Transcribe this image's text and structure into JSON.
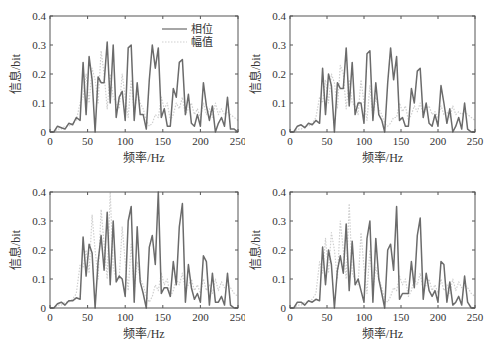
{
  "chart_data": [
    {
      "type": "line",
      "panel": "top-left",
      "title": "",
      "xlabel": "频率/Hz",
      "ylabel": "信息/bit",
      "xlim": [
        0,
        250
      ],
      "ylim": [
        0,
        0.4
      ],
      "xticks": [
        "0",
        "50",
        "100",
        "150",
        "200",
        "250"
      ],
      "yticks": [
        "0",
        "0.1",
        "0.2",
        "0.3",
        "0.4"
      ],
      "grid": false,
      "legend": {
        "position": "upper-right",
        "entries": [
          "相位",
          "幅值"
        ]
      },
      "x": [
        0,
        5,
        10,
        15,
        20,
        25,
        30,
        35,
        40,
        44,
        48,
        52,
        56,
        60,
        64,
        68,
        72,
        76,
        80,
        84,
        88,
        92,
        96,
        100,
        104,
        108,
        112,
        116,
        120,
        124,
        128,
        132,
        136,
        140,
        144,
        148,
        152,
        156,
        160,
        164,
        168,
        172,
        176,
        180,
        184,
        188,
        192,
        196,
        200,
        204,
        208,
        212,
        216,
        220,
        224,
        228,
        232,
        236,
        240,
        245,
        250
      ],
      "series": [
        {
          "name": "相位",
          "style": "solid dark gray",
          "values": [
            0,
            0,
            0.02,
            0.015,
            0.01,
            0.03,
            0.025,
            0.05,
            0.04,
            0.24,
            0.06,
            0.26,
            0.18,
            0,
            0.19,
            0.17,
            0.17,
            0.31,
            0.1,
            0.3,
            0.05,
            0.12,
            0.14,
            0.04,
            0.29,
            0.3,
            0.04,
            0.17,
            0.06,
            0.06,
            0.01,
            0.18,
            0.3,
            0.22,
            0.29,
            0.05,
            0.08,
            0.02,
            0.02,
            0.15,
            0.12,
            0.24,
            0.25,
            0.06,
            0.13,
            0.03,
            0.02,
            0.06,
            0.02,
            0.17,
            0.09,
            0.04,
            0.09,
            0,
            0.03,
            0.05,
            0.02,
            0.12,
            0.01,
            0.01,
            0
          ]
        },
        {
          "name": "幅值",
          "style": "dotted light gray",
          "values": [
            0,
            0,
            0.01,
            0.01,
            0.02,
            0.02,
            0.03,
            0.04,
            0.1,
            0.12,
            0.2,
            0.1,
            0.22,
            0.18,
            0.1,
            0.28,
            0.2,
            0.08,
            0.2,
            0.12,
            0.1,
            0.08,
            0.2,
            0.12,
            0.05,
            0.18,
            0.06,
            0.14,
            0.1,
            0.08,
            0.04,
            0.02,
            0.03,
            0.06,
            0.05,
            0.12,
            0.08,
            0.1,
            0.04,
            0.06,
            0.1,
            0.08,
            0.12,
            0.06,
            0.08,
            0.1,
            0.06,
            0.08,
            0.05,
            0.1,
            0.06,
            0.08,
            0.05,
            0.1,
            0.06,
            0.08,
            0.06,
            0.07,
            0.06,
            0.05,
            0.04
          ]
        }
      ]
    },
    {
      "type": "line",
      "panel": "top-right",
      "title": "",
      "xlabel": "频率/Hz",
      "ylabel": "信息/bit",
      "xlim": [
        0,
        250
      ],
      "ylim": [
        0,
        0.4
      ],
      "xticks": [
        "0",
        "50",
        "100",
        "150",
        "200",
        "250"
      ],
      "yticks": [
        "0",
        "0.1",
        "0.2",
        "0.3",
        "0.4"
      ],
      "grid": false,
      "x": [
        0,
        5,
        10,
        15,
        20,
        25,
        30,
        35,
        40,
        44,
        48,
        52,
        56,
        60,
        64,
        68,
        72,
        76,
        80,
        84,
        88,
        92,
        96,
        100,
        104,
        108,
        112,
        116,
        120,
        124,
        128,
        132,
        136,
        140,
        144,
        148,
        152,
        156,
        160,
        164,
        168,
        172,
        176,
        180,
        184,
        188,
        192,
        196,
        200,
        204,
        208,
        212,
        216,
        220,
        224,
        228,
        232,
        236,
        240,
        245,
        250
      ],
      "series": [
        {
          "name": "相位",
          "style": "solid dark gray",
          "values": [
            0,
            0,
            0.02,
            0.025,
            0.015,
            0.03,
            0.025,
            0.04,
            0.03,
            0.22,
            0.06,
            0.2,
            0.16,
            0,
            0.17,
            0.15,
            0.15,
            0.29,
            0.09,
            0.24,
            0.06,
            0.1,
            0.1,
            0.03,
            0.27,
            0.28,
            0.04,
            0.17,
            0.06,
            0.04,
            0,
            0.17,
            0.29,
            0.18,
            0.26,
            0.04,
            0.05,
            0.02,
            0.02,
            0.15,
            0.1,
            0.21,
            0.22,
            0.05,
            0.1,
            0.03,
            0.02,
            0.06,
            0.02,
            0.16,
            0.1,
            0.03,
            0.08,
            0,
            0.02,
            0.05,
            0.01,
            0.1,
            0.01,
            0,
            0
          ]
        },
        {
          "name": "幅值",
          "style": "dotted light gray",
          "values": [
            0,
            0,
            0.01,
            0.01,
            0.02,
            0.02,
            0.03,
            0.05,
            0.12,
            0.1,
            0.18,
            0.1,
            0.2,
            0.17,
            0.08,
            0.23,
            0.2,
            0.08,
            0.18,
            0.1,
            0.09,
            0.06,
            0.18,
            0.1,
            0.04,
            0.16,
            0.05,
            0.12,
            0.08,
            0.06,
            0.03,
            0.02,
            0.03,
            0.05,
            0.05,
            0.1,
            0.07,
            0.09,
            0.04,
            0.06,
            0.09,
            0.07,
            0.1,
            0.06,
            0.08,
            0.09,
            0.06,
            0.07,
            0.05,
            0.09,
            0.06,
            0.07,
            0.05,
            0.09,
            0.06,
            0.07,
            0.06,
            0.07,
            0.06,
            0.05,
            0.04
          ]
        }
      ]
    },
    {
      "type": "line",
      "panel": "bottom-left",
      "title": "",
      "xlabel": "频率/Hz",
      "ylabel": "信息/bit",
      "xlim": [
        0,
        250
      ],
      "ylim": [
        0,
        0.4
      ],
      "xticks": [
        "0",
        "50",
        "100",
        "150",
        "200",
        "250"
      ],
      "yticks": [
        "0",
        "0.1",
        "0.2",
        "0.3",
        "0.4"
      ],
      "grid": false,
      "x": [
        0,
        5,
        10,
        15,
        20,
        25,
        30,
        35,
        40,
        44,
        48,
        52,
        56,
        60,
        64,
        68,
        72,
        76,
        80,
        84,
        88,
        92,
        96,
        100,
        104,
        108,
        112,
        116,
        120,
        124,
        128,
        132,
        136,
        140,
        144,
        148,
        152,
        156,
        160,
        164,
        168,
        172,
        176,
        180,
        184,
        188,
        192,
        196,
        200,
        204,
        208,
        212,
        216,
        220,
        224,
        228,
        232,
        236,
        240,
        245,
        250
      ],
      "series": [
        {
          "name": "相位",
          "style": "solid dark gray",
          "values": [
            0,
            0,
            0.015,
            0.02,
            0.01,
            0.025,
            0.025,
            0.035,
            0.03,
            0.245,
            0.11,
            0.22,
            0.19,
            0,
            0.16,
            0.25,
            0.13,
            0.33,
            0.08,
            0.3,
            0.09,
            0.11,
            0.1,
            0.04,
            0.3,
            0.35,
            0.02,
            0.28,
            0.09,
            0.05,
            0,
            0.21,
            0.25,
            0.15,
            0.4,
            0.05,
            0.07,
            0.07,
            0.04,
            0.16,
            0.08,
            0.28,
            0.36,
            0.02,
            0.15,
            0.07,
            0.03,
            0.05,
            0.02,
            0.18,
            0.16,
            0.01,
            0.12,
            0.02,
            0.02,
            0.04,
            0.01,
            0.12,
            0.01,
            0,
            0
          ]
        },
        {
          "name": "幅值",
          "style": "dotted light gray",
          "values": [
            0,
            0,
            0.01,
            0.01,
            0.02,
            0.02,
            0.03,
            0.05,
            0.15,
            0.14,
            0.2,
            0.12,
            0.32,
            0.2,
            0.1,
            0.34,
            0.22,
            0.1,
            0.4,
            0.14,
            0.1,
            0.1,
            0.28,
            0.16,
            0.06,
            0.22,
            0.06,
            0.16,
            0.1,
            0.08,
            0.04,
            0.02,
            0.04,
            0.08,
            0.06,
            0.12,
            0.08,
            0.1,
            0.04,
            0.06,
            0.1,
            0.08,
            0.12,
            0.06,
            0.08,
            0.1,
            0.06,
            0.08,
            0.05,
            0.1,
            0.06,
            0.08,
            0.05,
            0.1,
            0.06,
            0.09,
            0.07,
            0.08,
            0.07,
            0.05,
            0.04
          ]
        }
      ]
    },
    {
      "type": "line",
      "panel": "bottom-right",
      "title": "",
      "xlabel": "频率/Hz",
      "ylabel": "信息/bit",
      "xlim": [
        0,
        250
      ],
      "ylim": [
        0,
        0.4
      ],
      "xticks": [
        "0",
        "50",
        "100",
        "150",
        "200",
        "250"
      ],
      "yticks": [
        "0",
        "0.1",
        "0.2",
        "0.3",
        "0.4"
      ],
      "grid": false,
      "x": [
        0,
        5,
        10,
        15,
        20,
        25,
        30,
        35,
        40,
        44,
        48,
        52,
        56,
        60,
        64,
        68,
        72,
        76,
        80,
        84,
        88,
        92,
        96,
        100,
        104,
        108,
        112,
        116,
        120,
        124,
        128,
        132,
        136,
        140,
        144,
        148,
        152,
        156,
        160,
        164,
        168,
        172,
        176,
        180,
        184,
        188,
        192,
        196,
        200,
        204,
        208,
        212,
        216,
        220,
        224,
        228,
        232,
        236,
        240,
        245,
        250
      ],
      "series": [
        {
          "name": "相位",
          "style": "solid dark gray",
          "values": [
            0,
            0,
            0.02,
            0.02,
            0.01,
            0.025,
            0.02,
            0.03,
            0.025,
            0.21,
            0.08,
            0.2,
            0.15,
            0,
            0.13,
            0.18,
            0.12,
            0.29,
            0.06,
            0.23,
            0.08,
            0.1,
            0.06,
            0.02,
            0.24,
            0.3,
            0.02,
            0.24,
            0.1,
            0.05,
            0,
            0.2,
            0.22,
            0.13,
            0.35,
            0.03,
            0.05,
            0.05,
            0.05,
            0.16,
            0.07,
            0.25,
            0.31,
            0.03,
            0.12,
            0.06,
            0.04,
            0.06,
            0.02,
            0.16,
            0.15,
            0.02,
            0.09,
            0.01,
            0.02,
            0.04,
            0.01,
            0.11,
            0.02,
            0,
            0
          ]
        },
        {
          "name": "幅值",
          "style": "dotted light gray",
          "values": [
            0,
            0,
            0.01,
            0.01,
            0.02,
            0.02,
            0.03,
            0.05,
            0.16,
            0.12,
            0.24,
            0.12,
            0.26,
            0.2,
            0.1,
            0.3,
            0.2,
            0.1,
            0.36,
            0.12,
            0.1,
            0.08,
            0.26,
            0.14,
            0.05,
            0.2,
            0.06,
            0.14,
            0.1,
            0.07,
            0.03,
            0.02,
            0.04,
            0.07,
            0.06,
            0.11,
            0.08,
            0.1,
            0.04,
            0.06,
            0.1,
            0.08,
            0.12,
            0.06,
            0.08,
            0.1,
            0.06,
            0.08,
            0.05,
            0.1,
            0.06,
            0.08,
            0.05,
            0.1,
            0.06,
            0.09,
            0.07,
            0.08,
            0.07,
            0.05,
            0.04
          ]
        }
      ]
    }
  ],
  "panels": [
    {
      "xlabel": "频率/Hz",
      "ylabel": "信息/bit",
      "legend": [
        "相位",
        "幅值"
      ]
    },
    {
      "xlabel": "频率/Hz",
      "ylabel": "信息/bit"
    },
    {
      "xlabel": "频率/Hz",
      "ylabel": "信息/bit"
    },
    {
      "xlabel": "频率/Hz",
      "ylabel": "信息/bit"
    }
  ],
  "colors": {
    "phase": "#6b6b6b",
    "amplitude": "#cfcfcf",
    "axis": "#555555"
  }
}
